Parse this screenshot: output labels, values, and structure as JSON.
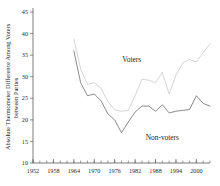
{
  "chart_data": {
    "type": "line",
    "title": "",
    "subtitle": "",
    "xlabel": "",
    "ylabel": "Absolute Thermometer Difference Among Voters between Parties",
    "ylabel_line1": "Absolute Thermometer Difference Among Voters",
    "ylabel_line2": "between Parties",
    "xlim": [
      1952,
      2004
    ],
    "ylim": [
      10,
      45
    ],
    "grid": false,
    "legend_position": "inline-annotation",
    "x_tick_labels": [
      "1952",
      "1958",
      "1964",
      "1970",
      "1976",
      "1982",
      "1988",
      "1994",
      "2000"
    ],
    "x_tick_values": [
      1952,
      1958,
      1964,
      1970,
      1976,
      1982,
      1988,
      1994,
      2000
    ],
    "x_minor_tick_interval": 2,
    "y_tick_labels": [
      "10",
      "15",
      "20",
      "25",
      "30",
      "35",
      "40",
      "45"
    ],
    "y_tick_values": [
      10,
      15,
      20,
      25,
      30,
      35,
      40,
      45
    ],
    "x": [
      1964,
      1966,
      1968,
      1970,
      1972,
      1974,
      1976,
      1978,
      1980,
      1982,
      1984,
      1986,
      1988,
      1990,
      1992,
      1994,
      1996,
      1998,
      2000,
      2002,
      2004
    ],
    "series": [
      {
        "name": "Voters",
        "color": "#cfcfcf",
        "label_x": 1981,
        "label_y": 33.5,
        "values": [
          38.7,
          31.8,
          28.2,
          28.6,
          27.3,
          24.2,
          22.3,
          22.0,
          22.2,
          25.6,
          29.4,
          29.2,
          28.6,
          31.0,
          26.0,
          30.4,
          33.2,
          34.0,
          33.4,
          35.6,
          37.6
        ]
      },
      {
        "name": "Non-voters",
        "color": "#6d6d6d",
        "label_x": 1990,
        "label_y": 15.4,
        "values": [
          36.0,
          28.6,
          25.6,
          26.0,
          24.4,
          21.4,
          20.0,
          17.0,
          19.5,
          21.8,
          23.2,
          23.2,
          22.0,
          23.5,
          21.6,
          22.0,
          22.2,
          22.4,
          25.6,
          23.8,
          23.2
        ]
      }
    ],
    "annotations": [
      {
        "text": "Voters",
        "x": 1981,
        "y": 33.5
      },
      {
        "text": "Non-voters",
        "x": 1990,
        "y": 15.4
      }
    ]
  },
  "axis": {
    "y_label_full": "Absolute Thermometer Difference Among Voters between Parties"
  }
}
